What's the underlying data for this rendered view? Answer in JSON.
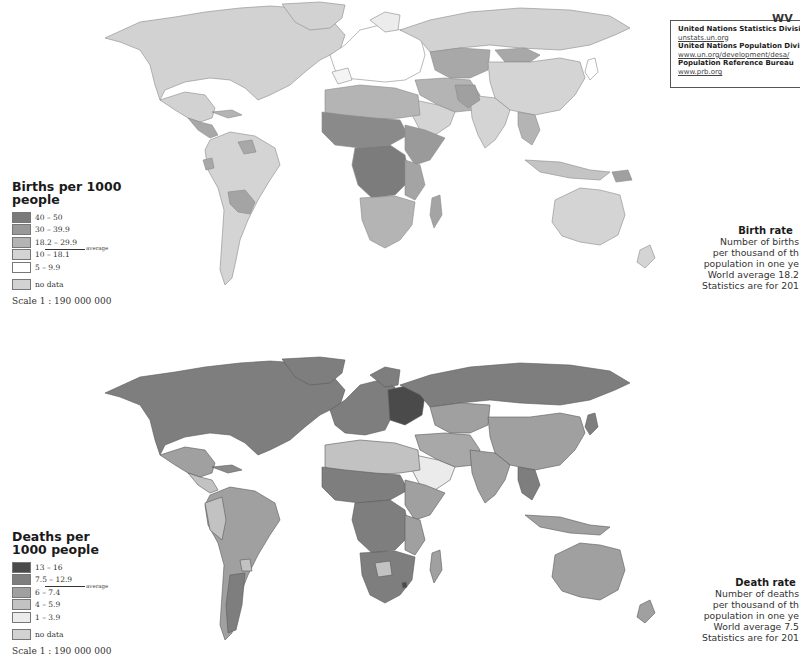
{
  "sources": {
    "items": [
      {
        "org": "United Nations Statistics Divisic",
        "url": "unstats.un.org"
      },
      {
        "org": "United Nations Population Divisi",
        "url": "www.un.org/development/desa/"
      },
      {
        "org": "Population Reference Bureau",
        "url": "www.prb.org"
      }
    ],
    "logo_text": "WV"
  },
  "birth_map": {
    "legend": {
      "title": "Births per 1000 people",
      "classes": [
        {
          "label": "40 – 50",
          "color": "#7a7a7a"
        },
        {
          "label": "30 – 39.9",
          "color": "#989898"
        },
        {
          "label": "18.2 – 29.9",
          "color": "#b4b4b4"
        },
        {
          "label": "10 – 18.1",
          "color": "#d4d4d4"
        },
        {
          "label": "5 – 9.9",
          "color": "#ffffff"
        }
      ],
      "average_label": "average",
      "no_data": {
        "label": "no data",
        "color": "#d2d2d2"
      },
      "scale": "Scale 1 : 190 000 000"
    },
    "info": {
      "title": "Birth rate",
      "lines": [
        "Number of births",
        "per thousand of th",
        "population in one ye",
        "World average 18.2",
        "Statistics are for 201"
      ]
    }
  },
  "death_map": {
    "legend": {
      "title": "Deaths per 1000 people",
      "classes": [
        {
          "label": "13 – 16",
          "color": "#4a4a4a"
        },
        {
          "label": "7.5 – 12.9",
          "color": "#7e7e7e"
        },
        {
          "label": "6 – 7.4",
          "color": "#a0a0a0"
        },
        {
          "label": "4 – 5.9",
          "color": "#c2c2c2"
        },
        {
          "label": "1 – 3.9",
          "color": "#ebebeb"
        }
      ],
      "average_label": "average",
      "no_data": {
        "label": "no data",
        "color": "#d2d2d2"
      },
      "scale": "Scale 1 : 190 000 000"
    },
    "info": {
      "title": "Death rate",
      "lines": [
        "Number of deaths",
        "per thousand of th",
        "population in one ye",
        "World average 7.5",
        "Statistics are for 201"
      ]
    }
  }
}
